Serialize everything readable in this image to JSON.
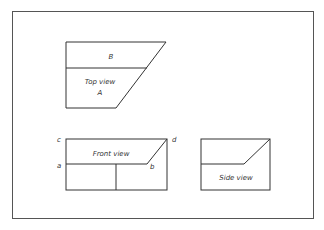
{
  "diagram": {
    "type": "orthographic projection",
    "views": {
      "top": {
        "label": "Top view",
        "regions": [
          "B",
          "A"
        ]
      },
      "front": {
        "label": "Front view",
        "points": [
          "a",
          "b",
          "c",
          "d"
        ]
      },
      "side": {
        "label": "Side view"
      }
    }
  }
}
